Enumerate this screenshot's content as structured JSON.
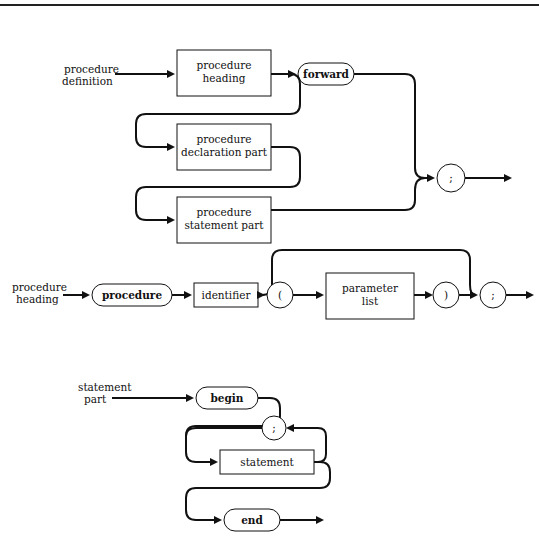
{
  "diagrams": {
    "procedure_definition": {
      "label_line1": "procedure",
      "label_line2": "definition",
      "boxes": [
        {
          "line1": "procedure",
          "line2": "heading"
        },
        {
          "line1": "procedure",
          "line2": "declaration part"
        },
        {
          "line1": "procedure",
          "line2": "statement part"
        }
      ],
      "terminals": {
        "forward": "forward",
        "semicolon": ";"
      }
    },
    "procedure_heading": {
      "label_line1": "procedure",
      "label_line2": "heading",
      "terminals": {
        "procedure": "procedure",
        "lparen": "(",
        "rparen": ")",
        "semicolon": ";"
      },
      "boxes": [
        {
          "line1": "identifier"
        },
        {
          "line1": "parameter",
          "line2": "list"
        }
      ]
    },
    "statement_part": {
      "label_line1": "statement",
      "label_line2": "part",
      "terminals": {
        "begin": "begin",
        "semicolon": ";",
        "end": "end"
      },
      "boxes": [
        {
          "line1": "statement"
        }
      ]
    }
  },
  "colors": {
    "ink": "#111111",
    "background": "#ffffff"
  }
}
